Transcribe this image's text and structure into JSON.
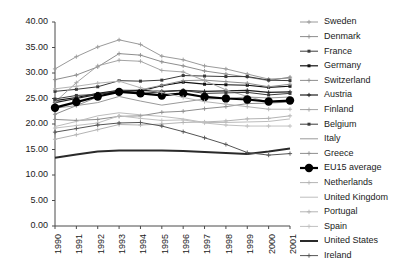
{
  "chart_data": {
    "type": "line",
    "title": "",
    "xlabel": "",
    "ylabel": "",
    "ylim": [
      0,
      40
    ],
    "ytick_step": 5,
    "grid": false,
    "legend_position": "right",
    "x": [
      1990,
      1991,
      1992,
      1993,
      1994,
      1995,
      1996,
      1997,
      1998,
      1999,
      2000,
      2001
    ],
    "ytick_labels": [
      "0.00",
      "5.00",
      "10.00",
      "15.00",
      "20.00",
      "25.00",
      "30.00",
      "35.00",
      "40.00"
    ],
    "xtick_labels": [
      "1990",
      "1991",
      "1992",
      "1993",
      "1994",
      "1995",
      "1996",
      "1997",
      "1998",
      "1999",
      "2000",
      "2001"
    ],
    "series": [
      {
        "name": "Sweden",
        "color": "#9a9a9a",
        "width": 1,
        "marker": "plus",
        "marker_size": 3,
        "values": [
          30.8,
          33.2,
          35.1,
          36.5,
          35.6,
          33.3,
          32.6,
          31.4,
          30.8,
          29.8,
          28.8,
          29.0
        ]
      },
      {
        "name": "Denmark",
        "color": "#8e8e8e",
        "width": 1,
        "marker": "plus",
        "marker_size": 3,
        "values": [
          28.7,
          29.6,
          31.2,
          33.8,
          33.5,
          32.2,
          31.4,
          30.4,
          29.8,
          29.2,
          28.5,
          29.2
        ]
      },
      {
        "name": "France",
        "color": "#3a3a3a",
        "width": 1,
        "marker": "square",
        "marker_size": 3,
        "values": [
          26.4,
          26.8,
          27.3,
          28.5,
          28.4,
          28.6,
          29.5,
          29.4,
          29.3,
          29.3,
          28.6,
          28.5
        ]
      },
      {
        "name": "Germany",
        "color": "#111111",
        "width": 1.2,
        "marker": "square",
        "marker_size": 3,
        "values": [
          24.6,
          25.2,
          26.0,
          26.6,
          26.5,
          27.5,
          28.2,
          27.8,
          27.7,
          27.6,
          27.2,
          27.4
        ]
      },
      {
        "name": "Switzerland",
        "color": "#8e8e8e",
        "width": 1,
        "marker": "plus",
        "marker_size": 3,
        "values": [
          21.9,
          23.6,
          25.3,
          26.6,
          26.7,
          27.6,
          28.5,
          28.6,
          28.3,
          28.0,
          27.3,
          27.8
        ]
      },
      {
        "name": "Austria",
        "color": "#1e1e1e",
        "width": 1.2,
        "marker": "plus",
        "marker_size": 3,
        "values": [
          24.2,
          25.0,
          25.8,
          26.4,
          26.6,
          26.4,
          26.6,
          26.4,
          26.5,
          26.6,
          26.2,
          26.3
        ]
      },
      {
        "name": "Finland",
        "color": "#a4a4a4",
        "width": 1,
        "marker": "plus",
        "marker_size": 3,
        "values": [
          24.3,
          28.1,
          31.4,
          32.5,
          32.3,
          30.5,
          30.2,
          28.5,
          26.7,
          25.4,
          24.3,
          24.7
        ]
      },
      {
        "name": "Belgium",
        "color": "#3a3a3a",
        "width": 1,
        "marker": "square",
        "marker_size": 3,
        "values": [
          24.9,
          25.6,
          25.8,
          26.6,
          26.0,
          26.3,
          26.6,
          26.0,
          26.1,
          26.2,
          25.7,
          26.0
        ]
      },
      {
        "name": "Italy",
        "color": "#9a9a9a",
        "width": 1,
        "marker": "none",
        "marker_size": 0,
        "values": [
          23.1,
          23.6,
          24.2,
          25.4,
          24.5,
          23.7,
          24.3,
          24.9,
          25.0,
          25.3,
          25.1,
          25.3
        ]
      },
      {
        "name": "Greece",
        "color": "#8e8e8e",
        "width": 1,
        "marker": "plus",
        "marker_size": 3,
        "values": [
          20.9,
          20.7,
          20.9,
          21.5,
          21.6,
          22.3,
          22.5,
          23.0,
          23.4,
          24.0,
          24.1,
          24.3
        ]
      },
      {
        "name": "EU15 average",
        "color": "#000000",
        "width": 2.2,
        "marker": "bigcircle",
        "marker_size": 4.2,
        "values": [
          23.2,
          24.3,
          25.4,
          26.3,
          26.0,
          25.6,
          26.0,
          25.3,
          25.0,
          24.8,
          24.4,
          24.6
        ]
      },
      {
        "name": "Netherlands",
        "color": "#b4b4b4",
        "width": 1,
        "marker": "plus",
        "marker_size": 3,
        "values": [
          26.9,
          27.4,
          28.0,
          28.4,
          27.1,
          26.2,
          25.2,
          24.4,
          23.9,
          23.4,
          22.9,
          22.9
        ]
      },
      {
        "name": "United Kingdom",
        "color": "#bdbdbd",
        "width": 1,
        "marker": "none",
        "marker_size": 0,
        "values": [
          19.5,
          20.5,
          21.6,
          22.2,
          21.8,
          21.5,
          21.0,
          20.3,
          20.3,
          20.4,
          20.5,
          21.0
        ]
      },
      {
        "name": "Portugal",
        "color": "#b4b4b4",
        "width": 1,
        "marker": "plus",
        "marker_size": 3,
        "values": [
          17.0,
          17.9,
          18.9,
          19.9,
          19.8,
          20.0,
          20.3,
          20.4,
          20.6,
          21.0,
          21.1,
          21.6
        ]
      },
      {
        "name": "Spain",
        "color": "#c0c0c0",
        "width": 1,
        "marker": "plus",
        "marker_size": 3,
        "values": [
          19.2,
          19.7,
          20.2,
          21.6,
          21.1,
          20.7,
          20.8,
          20.2,
          19.8,
          19.6,
          19.6,
          19.6
        ]
      },
      {
        "name": "United States",
        "color": "#2a2a2a",
        "width": 2.0,
        "marker": "none",
        "marker_size": 0,
        "values": [
          13.4,
          14.0,
          14.6,
          14.8,
          14.8,
          14.8,
          14.7,
          14.5,
          14.3,
          14.1,
          14.6,
          15.2
        ]
      },
      {
        "name": "Ireland",
        "color": "#555555",
        "width": 1,
        "marker": "plus",
        "marker_size": 3,
        "values": [
          18.4,
          19.1,
          19.8,
          20.2,
          20.3,
          19.6,
          18.5,
          17.3,
          16.0,
          14.4,
          13.9,
          14.2
        ]
      }
    ]
  },
  "legend": {
    "items": [
      {
        "label": "Sweden"
      },
      {
        "label": "Denmark"
      },
      {
        "label": "France"
      },
      {
        "label": "Germany"
      },
      {
        "label": "Switzerland"
      },
      {
        "label": "Austria"
      },
      {
        "label": "Finland"
      },
      {
        "label": "Belgium"
      },
      {
        "label": "Italy"
      },
      {
        "label": "Greece"
      },
      {
        "label": "EU15 average"
      },
      {
        "label": "Netherlands"
      },
      {
        "label": "United Kingdom"
      },
      {
        "label": "Portugal"
      },
      {
        "label": "Spain"
      },
      {
        "label": "United States"
      },
      {
        "label": "Ireland"
      }
    ]
  }
}
